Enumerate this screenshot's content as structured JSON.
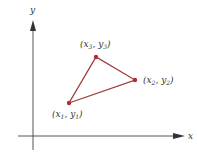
{
  "axes": {
    "x_label": "x",
    "y_label": "y",
    "color": "#555555"
  },
  "triangle": {
    "color": "#a33a3a",
    "vertices": [
      {
        "id": "1",
        "label_var_x": "x",
        "label_var_y": "y",
        "sub": "1",
        "px": [
          69,
          103
        ]
      },
      {
        "id": "2",
        "label_var_x": "x",
        "label_var_y": "y",
        "sub": "2",
        "px": [
          135,
          80
        ]
      },
      {
        "id": "3",
        "label_var_x": "x",
        "label_var_y": "y",
        "sub": "3",
        "px": [
          96,
          57
        ]
      }
    ]
  },
  "labels": {
    "p1": {
      "open": "(",
      "x": "x",
      "sub_x": "1",
      "comma": ", ",
      "y": "y",
      "sub_y": "1",
      "close": ")"
    },
    "p2": {
      "open": "(",
      "x": "x",
      "sub_x": "2",
      "comma": ", ",
      "y": "y",
      "sub_y": "2",
      "close": ")"
    },
    "p3": {
      "open": "(",
      "x": "x",
      "sub_x": "3",
      "comma": ", ",
      "y": "y",
      "sub_y": "3",
      "close": ")"
    }
  }
}
